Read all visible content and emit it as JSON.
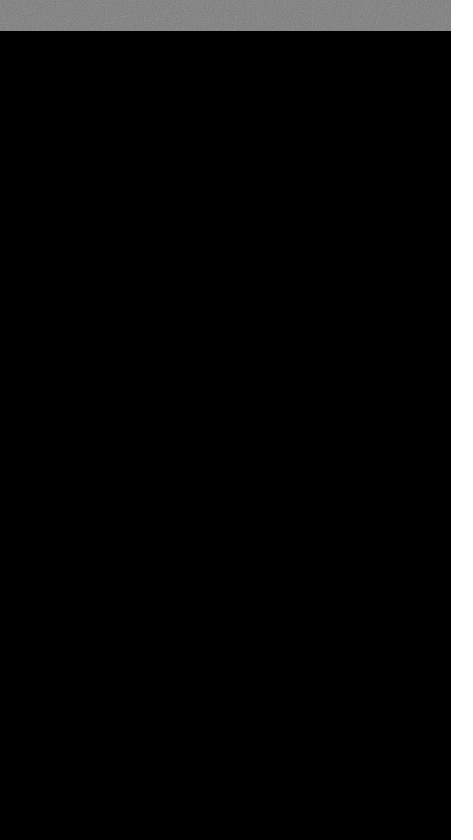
{
  "image": {
    "subject": "molecular surface rendering of a spherical virus capsid",
    "palette": {
      "background": "#000000",
      "header_band": "#7b7b7b",
      "right_strip": "#ffffff",
      "protein_light": "#c9c9c9",
      "protein_mid": "#9a9a9a",
      "protein_dark": "#5e5e5e",
      "crevice": "#1a1a1a"
    }
  }
}
